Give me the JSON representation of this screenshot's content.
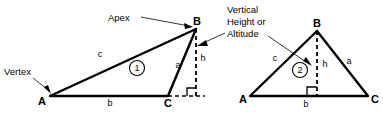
{
  "figure": {
    "background_color": "#ffffff",
    "line_color": "#000000",
    "callouts": {
      "apex": "Apex",
      "vertex": "Vertex",
      "vertical_height_line1": "Vertical",
      "vertical_height_line2": "Height or",
      "vertical_height_line3": "Altitude"
    },
    "triangles": [
      {
        "id": "triangle-1",
        "number_label": "1",
        "vertices": {
          "a": "A",
          "b": "B",
          "c": "C"
        },
        "sides": {
          "c": "c",
          "a": "a",
          "b": "b"
        },
        "altitude_label": "h",
        "altitude_position": "outside",
        "type": "obtuse"
      },
      {
        "id": "triangle-2",
        "number_label": "2",
        "vertices": {
          "a": "A",
          "b": "B",
          "c": "C"
        },
        "sides": {
          "c": "c",
          "a": "a",
          "b": "b"
        },
        "altitude_label": "h",
        "altitude_position": "inside",
        "type": "acute"
      }
    ]
  }
}
